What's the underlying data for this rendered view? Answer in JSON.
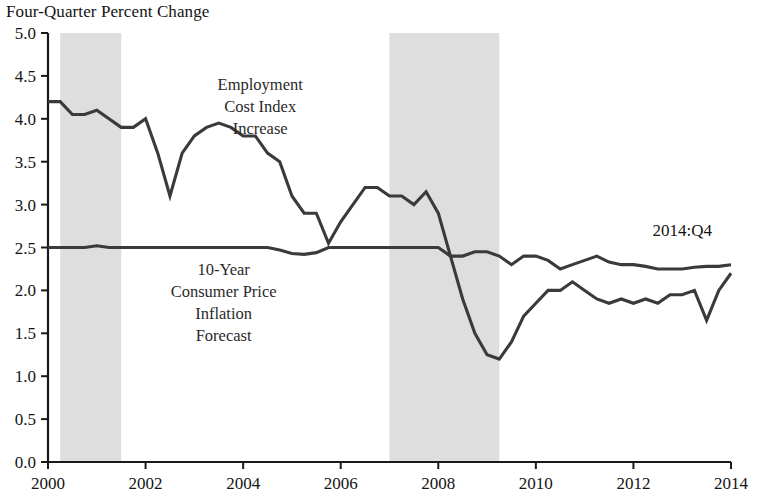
{
  "chart_data": {
    "type": "line",
    "title": "Four-Quarter Percent Change",
    "xlabel": "",
    "ylabel": "",
    "xlim": [
      2000.0,
      2014.0
    ],
    "ylim": [
      0.0,
      5.0
    ],
    "grid": false,
    "legend": "inline-annotations",
    "y_ticks": [
      "0.0",
      "0.5",
      "1.0",
      "1.5",
      "2.0",
      "2.5",
      "3.0",
      "3.5",
      "4.0",
      "4.5",
      "5.0"
    ],
    "y_tick_values": [
      0.0,
      0.5,
      1.0,
      1.5,
      2.0,
      2.5,
      3.0,
      3.5,
      4.0,
      4.5,
      5.0
    ],
    "x_ticks": [
      "2000",
      "2002",
      "2004",
      "2006",
      "2008",
      "2010",
      "2012",
      "2014"
    ],
    "x_tick_values": [
      2000,
      2002,
      2004,
      2006,
      2008,
      2010,
      2012,
      2014
    ],
    "annotations": [
      {
        "name": "eci-label",
        "text_lines": [
          "Employment",
          "Cost Index",
          "Increase"
        ],
        "x": 2004.35,
        "y": 4.33
      },
      {
        "name": "cpi-label",
        "text_lines": [
          "10-Year",
          "Consumer Price",
          "Inflation",
          "Forecast"
        ],
        "x": 2003.6,
        "y": 2.18
      },
      {
        "name": "endpoint-label",
        "text_lines": [
          "2014:Q4"
        ],
        "x": 2013.0,
        "y": 2.63
      }
    ],
    "recession_bands": [
      {
        "name": "recession-2001",
        "start": 2000.25,
        "end": 2001.5
      },
      {
        "name": "recession-2007-2009",
        "start": 2007.0,
        "end": 2009.25
      }
    ],
    "x": [
      2000.0,
      2000.25,
      2000.5,
      2000.75,
      2001.0,
      2001.25,
      2001.5,
      2001.75,
      2002.0,
      2002.25,
      2002.5,
      2002.75,
      2003.0,
      2003.25,
      2003.5,
      2003.75,
      2004.0,
      2004.25,
      2004.5,
      2004.75,
      2005.0,
      2005.25,
      2005.5,
      2005.75,
      2006.0,
      2006.25,
      2006.5,
      2006.75,
      2007.0,
      2007.25,
      2007.5,
      2007.75,
      2008.0,
      2008.25,
      2008.5,
      2008.75,
      2009.0,
      2009.25,
      2009.5,
      2009.75,
      2010.0,
      2010.25,
      2010.5,
      2010.75,
      2011.0,
      2011.25,
      2011.5,
      2011.75,
      2012.0,
      2012.25,
      2012.5,
      2012.75,
      2013.0,
      2013.25,
      2013.5,
      2013.75,
      2014.0
    ],
    "series": [
      {
        "name": "Employment Cost Index Increase",
        "values": [
          4.2,
          4.2,
          4.05,
          4.05,
          4.1,
          4.0,
          3.9,
          3.9,
          4.0,
          3.6,
          3.1,
          3.6,
          3.8,
          3.9,
          3.95,
          3.9,
          3.8,
          3.8,
          3.6,
          3.5,
          3.1,
          2.9,
          2.9,
          2.55,
          2.8,
          3.0,
          3.2,
          3.2,
          3.1,
          3.1,
          3.0,
          3.15,
          2.9,
          2.4,
          1.9,
          1.5,
          1.25,
          1.2,
          1.4,
          1.7,
          1.85,
          2.0,
          2.0,
          2.1,
          2.0,
          1.9,
          1.85,
          1.9,
          1.85,
          1.9,
          1.85,
          1.95,
          1.95,
          2.0,
          1.65,
          2.0,
          2.2
        ]
      },
      {
        "name": "10-Year Consumer Price Inflation Forecast",
        "values": [
          2.5,
          2.5,
          2.5,
          2.5,
          2.52,
          2.5,
          2.5,
          2.5,
          2.5,
          2.5,
          2.5,
          2.5,
          2.5,
          2.5,
          2.5,
          2.5,
          2.5,
          2.5,
          2.5,
          2.47,
          2.43,
          2.42,
          2.44,
          2.5,
          2.5,
          2.5,
          2.5,
          2.5,
          2.5,
          2.5,
          2.5,
          2.5,
          2.5,
          2.4,
          2.4,
          2.45,
          2.45,
          2.4,
          2.3,
          2.4,
          2.4,
          2.35,
          2.25,
          2.3,
          2.35,
          2.4,
          2.33,
          2.3,
          2.3,
          2.28,
          2.25,
          2.25,
          2.25,
          2.27,
          2.28,
          2.28,
          2.3
        ]
      }
    ]
  }
}
